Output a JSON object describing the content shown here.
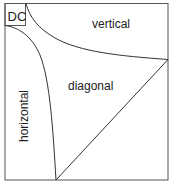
{
  "diagram": {
    "corner_label": "DC",
    "regions": {
      "vertical": "vertical",
      "diagonal": "diagonal",
      "horizontal": "horizontal"
    },
    "colors": {
      "line": "#333333",
      "frame": "#555555",
      "text": "#222222"
    }
  }
}
